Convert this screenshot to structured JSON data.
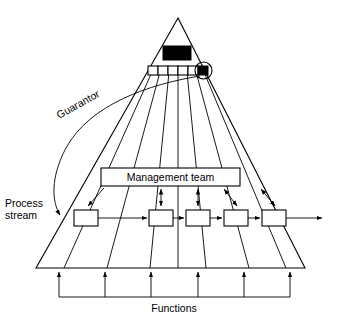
{
  "diagram": {
    "title_labels": {
      "guarantor": "Guarantor",
      "process_stream_line1": "Process",
      "process_stream_line2": "stream",
      "management_team": "Management team",
      "functions": "Functions"
    },
    "colors": {
      "stroke": "#000000",
      "fill": "#ffffff",
      "accent_black": "#000000",
      "background": "#ffffff"
    },
    "pyramid": {
      "apex_x": 178,
      "apex_y": 18,
      "base_left_x": 36,
      "base_right_x": 305,
      "base_y": 268,
      "internal_line_count": 6
    },
    "top_block": {
      "name": "executive-block",
      "filled": true,
      "x": 163,
      "y": 46,
      "width": 28,
      "height": 14
    },
    "top_box_row": {
      "name": "senior-manager-row",
      "count": 6,
      "filled_index": 5,
      "circled_index": 5,
      "y": 66,
      "box_width": 10,
      "box_height": 9
    },
    "management_team_box": {
      "x": 101,
      "y": 168,
      "width": 139,
      "height": 18
    },
    "process_boxes": {
      "count": 5,
      "y": 210,
      "width": 24,
      "height": 16,
      "x_positions": [
        74,
        149,
        186,
        224,
        262
      ]
    },
    "management_links": {
      "count": 5,
      "types": [
        "single-down",
        "double",
        "double",
        "double",
        "double"
      ]
    },
    "functions_bar": {
      "arrow_count": 6,
      "bar_y": 297,
      "bar_left_x": 59,
      "bar_right_x": 290
    },
    "process_stream_arrow": {
      "direction": "left-to-right",
      "entry_x": 62,
      "exit_x": 322,
      "y": 218
    }
  }
}
